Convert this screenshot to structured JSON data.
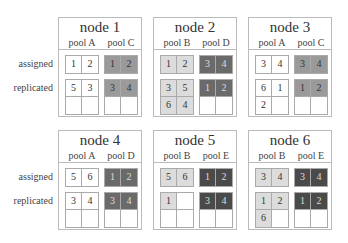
{
  "row_labels": {
    "assigned": "assigned",
    "replicated": "replicated"
  },
  "pool_colors": {
    "A": "#ffffff",
    "B": "#dcdcdc",
    "C": "#9a9a9a",
    "D": "#6a6a6a",
    "E": "#4a4a4a"
  },
  "pool_text_colors": {
    "A": "#333333",
    "B": "#333333",
    "C": "#333333",
    "D": "#dddddd",
    "E": "#dddddd"
  },
  "nodes": [
    {
      "title": "node 1",
      "pools": [
        {
          "label": "pool A",
          "key": "A",
          "assigned": [
            "1",
            "2"
          ],
          "replicated": [
            "5",
            "3",
            "",
            ""
          ]
        },
        {
          "label": "pool C",
          "key": "C",
          "assigned": [
            "1",
            "2"
          ],
          "replicated": [
            "3",
            "4",
            "",
            ""
          ]
        }
      ]
    },
    {
      "title": "node 2",
      "pools": [
        {
          "label": "pool B",
          "key": "B",
          "assigned": [
            "1",
            "2"
          ],
          "replicated": [
            "3",
            "5",
            "6",
            "4"
          ]
        },
        {
          "label": "pool D",
          "key": "D",
          "assigned": [
            "3",
            "4"
          ],
          "replicated": [
            "1",
            "2",
            "",
            ""
          ]
        }
      ]
    },
    {
      "title": "node 3",
      "pools": [
        {
          "label": "pool A",
          "key": "A",
          "assigned": [
            "3",
            "4"
          ],
          "replicated": [
            "6",
            "1",
            "2",
            ""
          ]
        },
        {
          "label": "pool C",
          "key": "C",
          "assigned": [
            "3",
            "4"
          ],
          "replicated": [
            "1",
            "2",
            "",
            ""
          ]
        }
      ]
    },
    {
      "title": "node 4",
      "pools": [
        {
          "label": "pool A",
          "key": "A",
          "assigned": [
            "5",
            "6"
          ],
          "replicated": [
            "3",
            "4",
            "",
            ""
          ]
        },
        {
          "label": "pool D",
          "key": "D",
          "assigned": [
            "1",
            "2"
          ],
          "replicated": [
            "3",
            "4",
            "",
            ""
          ]
        }
      ]
    },
    {
      "title": "node 5",
      "pools": [
        {
          "label": "pool B",
          "key": "B",
          "assigned": [
            "5",
            "6"
          ],
          "replicated": [
            "1",
            "",
            "",
            ""
          ]
        },
        {
          "label": "pool E",
          "key": "E",
          "assigned": [
            "1",
            "2"
          ],
          "replicated": [
            "3",
            "4",
            "",
            ""
          ]
        }
      ]
    },
    {
      "title": "node 6",
      "pools": [
        {
          "label": "pool B",
          "key": "B",
          "assigned": [
            "3",
            "4"
          ],
          "replicated": [
            "1",
            "2",
            "6",
            ""
          ]
        },
        {
          "label": "pool E",
          "key": "E",
          "assigned": [
            "3",
            "4"
          ],
          "replicated": [
            "1",
            "2",
            "",
            ""
          ]
        }
      ]
    }
  ]
}
